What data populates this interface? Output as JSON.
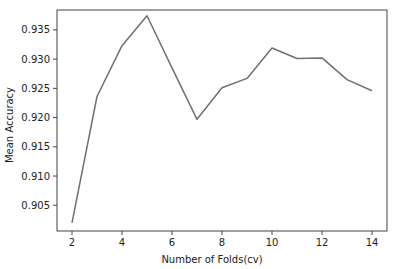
{
  "chart_data": {
    "type": "line",
    "title": "",
    "xlabel": "Number of Folds(cv)",
    "ylabel": "Mean Accuracy",
    "x": [
      2,
      3,
      4,
      5,
      6,
      7,
      8,
      9,
      10,
      11,
      12,
      13,
      14
    ],
    "series": [
      {
        "name": "Mean Accuracy",
        "values": [
          0.902,
          0.9236,
          0.9323,
          0.9374,
          0.9285,
          0.9197,
          0.9251,
          0.9267,
          0.9319,
          0.9301,
          0.9302,
          0.9265,
          0.9246
        ],
        "color": "#707070"
      }
    ],
    "xticks": [
      2,
      4,
      6,
      8,
      10,
      12,
      14
    ],
    "xtick_labels": [
      "2",
      "4",
      "6",
      "8",
      "10",
      "12",
      "14"
    ],
    "yticks": [
      0.905,
      0.91,
      0.915,
      0.92,
      0.925,
      0.93,
      0.935
    ],
    "ytick_labels": [
      "0.905",
      "0.910",
      "0.915",
      "0.920",
      "0.925",
      "0.930",
      "0.935"
    ],
    "xlim": [
      1.4,
      14.6
    ],
    "ylim": [
      0.9006,
      0.9384
    ],
    "grid": false,
    "legend": null
  }
}
